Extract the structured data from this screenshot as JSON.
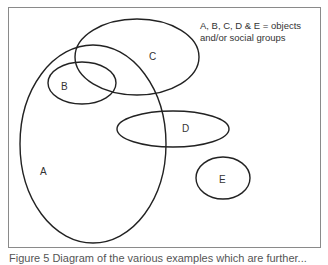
{
  "legend": {
    "line1": "A, B, C, D & E = objects",
    "line2": "and/or social groups"
  },
  "sets": [
    {
      "id": "A",
      "label": "A",
      "cx": 93,
      "cy": 144,
      "rx": 73,
      "ry": 99,
      "label_x": 40,
      "label_y": 166
    },
    {
      "id": "B",
      "label": "B",
      "cx": 82,
      "cy": 83,
      "rx": 34,
      "ry": 21,
      "label_x": 61,
      "label_y": 81
    },
    {
      "id": "C",
      "label": "C",
      "cx": 137,
      "cy": 57,
      "rx": 62,
      "ry": 38,
      "label_x": 149,
      "label_y": 51
    },
    {
      "id": "D",
      "label": "D",
      "cx": 173,
      "cy": 129,
      "rx": 56,
      "ry": 18,
      "label_x": 182,
      "label_y": 123
    },
    {
      "id": "E",
      "label": "E",
      "cx": 223,
      "cy": 178,
      "rx": 27,
      "ry": 21,
      "label_x": 219,
      "label_y": 174
    }
  ],
  "caption": "Figure 5  Diagram of the various examples which are further..."
}
